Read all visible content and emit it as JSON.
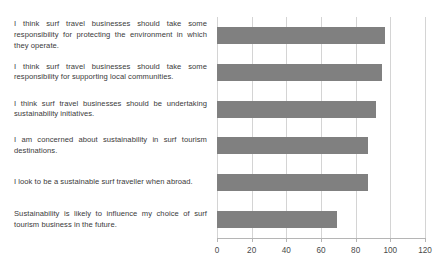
{
  "chart_data": {
    "type": "bar",
    "orientation": "horizontal",
    "title": "",
    "subtitle": "",
    "xlabel": "",
    "ylabel": "",
    "xlim": [
      0,
      120
    ],
    "ylim": [
      0,
      6
    ],
    "grid": true,
    "legend": false,
    "legend_position": "none",
    "bar_color": "#808080",
    "gridline_color": "#d4d4d4",
    "axis_color": "#b5b5b5",
    "text_color": "#3a3a3a",
    "background_color": "#ffffff",
    "xticks": [
      0,
      20,
      40,
      60,
      80,
      100,
      120
    ],
    "xtick_labels": [
      "0",
      "20",
      "40",
      "60",
      "80",
      "100",
      "120"
    ],
    "categories": [
      "I think surf travel businesses should take some responsibility for protecting the environment in which they operate.",
      "I think surf travel businesses should take some responsibility for supporting local communities.",
      "I think surf travel businesses should be undertaking sustainability initiatives.",
      "I am concerned about sustainability in surf tourism destinations.",
      "I look to be a sustainable surf traveller when abroad.",
      "Sustainability is likely to influence my choice of surf tourism business in the future."
    ],
    "values": [
      97,
      95,
      92,
      87,
      87,
      69
    ],
    "series": [
      {
        "name": "",
        "values": [
          97,
          95,
          92,
          87,
          87,
          69
        ]
      }
    ]
  }
}
